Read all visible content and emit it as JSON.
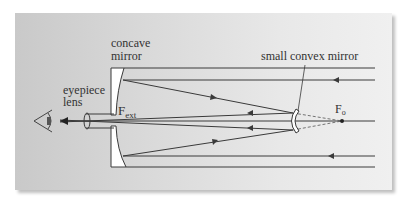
{
  "diagram": {
    "labels": {
      "concave_mirror_line1": "concave",
      "concave_mirror_line2": "mirror",
      "eyepiece_line1": "eyepiece",
      "eyepiece_line2": "lens",
      "convex_mirror": "small convex mirror",
      "f_ext_main": "F",
      "f_ext_sub": "ext",
      "f_o_main": "F",
      "f_o_sub": "o"
    },
    "colors": {
      "line": "#3a3a3a",
      "mirror_fill": "#ffffff",
      "dashed": "#555555"
    }
  }
}
